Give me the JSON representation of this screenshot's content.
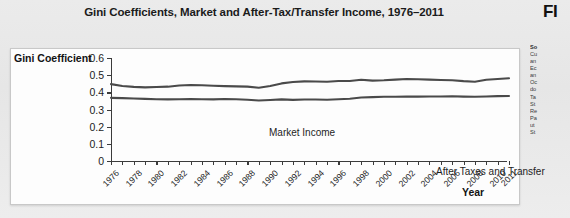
{
  "title": "Gini Coefficients, Market and After-Tax/Transfer Income, 1976–2011",
  "figure_tag": "FI",
  "axis": {
    "y_title": "Gini Coefficient",
    "x_title": "Year"
  },
  "annotations": {
    "market": "Market Income",
    "after": "After Taxes and Transfer"
  },
  "source": {
    "head": "So",
    "lines": [
      "Cu",
      "an",
      "Ec",
      "an",
      "Oc",
      "do",
      "Ta",
      "St",
      "Re",
      "Pa",
      "ut",
      "St"
    ]
  },
  "colors": {
    "page": "#e8e8e8",
    "panel": "#fdfdfd",
    "axis": "#3b3b3b",
    "series_market": "#4a4a4a",
    "series_after": "#4a4a4a",
    "text": "#1c1c1c"
  },
  "chart_data": {
    "type": "line",
    "title": "Gini Coefficients, Market and After-Tax/Transfer Income, 1976–2011",
    "xlabel": "Year",
    "ylabel": "Gini Coefficient",
    "ylim": [
      0,
      0.6
    ],
    "ytick_values": [
      0,
      0.1,
      0.2,
      0.3,
      0.4,
      0.5,
      0.6
    ],
    "ytick_labels": [
      "0",
      "0.1",
      "0.2",
      "0.3",
      "0.4",
      "0.5",
      "0.6"
    ],
    "xlim": [
      1976,
      2011
    ],
    "xtick_values": [
      1976,
      1977,
      1978,
      1979,
      1980,
      1981,
      1982,
      1983,
      1984,
      1985,
      1986,
      1987,
      1988,
      1989,
      1990,
      1991,
      1992,
      1993,
      1994,
      1995,
      1996,
      1997,
      1998,
      1999,
      2000,
      2001,
      2002,
      2003,
      2004,
      2005,
      2006,
      2007,
      2008,
      2009,
      2010,
      2011
    ],
    "xtick_labels_shown": [
      "1976",
      "1978",
      "1980",
      "1982",
      "1984",
      "1986",
      "1988",
      "1990",
      "1992",
      "1994",
      "1996",
      "1998",
      "2000",
      "2002",
      "2004",
      "2006",
      "2008",
      "2010",
      "2011"
    ],
    "grid": false,
    "legend": "inline-annotations",
    "x": [
      1976,
      1977,
      1978,
      1979,
      1980,
      1981,
      1982,
      1983,
      1984,
      1985,
      1986,
      1987,
      1988,
      1989,
      1990,
      1991,
      1992,
      1993,
      1994,
      1995,
      1996,
      1997,
      1998,
      1999,
      2000,
      2001,
      2002,
      2003,
      2004,
      2005,
      2006,
      2007,
      2008,
      2009,
      2010,
      2011
    ],
    "series": [
      {
        "name": "Market Income",
        "values": [
          0.448,
          0.437,
          0.432,
          0.429,
          0.431,
          0.433,
          0.44,
          0.443,
          0.441,
          0.438,
          0.436,
          0.435,
          0.433,
          0.427,
          0.437,
          0.452,
          0.46,
          0.464,
          0.463,
          0.462,
          0.466,
          0.466,
          0.473,
          0.468,
          0.47,
          0.474,
          0.478,
          0.476,
          0.474,
          0.472,
          0.47,
          0.465,
          0.462,
          0.473,
          0.478,
          0.482
        ]
      },
      {
        "name": "After Taxes and Transfer",
        "values": [
          0.368,
          0.366,
          0.364,
          0.362,
          0.36,
          0.359,
          0.36,
          0.361,
          0.36,
          0.359,
          0.361,
          0.36,
          0.357,
          0.352,
          0.355,
          0.359,
          0.356,
          0.358,
          0.358,
          0.357,
          0.36,
          0.363,
          0.37,
          0.372,
          0.374,
          0.374,
          0.376,
          0.375,
          0.376,
          0.376,
          0.377,
          0.375,
          0.374,
          0.376,
          0.378,
          0.379
        ]
      }
    ]
  }
}
